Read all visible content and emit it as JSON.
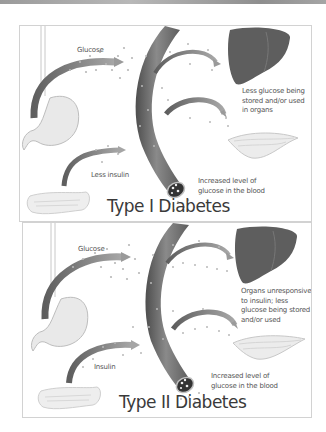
{
  "figure": {
    "colors": {
      "background": "#ffffff",
      "panel_border": "#d2d2d2",
      "arrow": "#7a7a7a",
      "vessel": "#6e6e6e",
      "liver": "#5a5a5a",
      "organ_light": "#e6e6e6",
      "text": "#555555",
      "title_text": "#3a3a3a"
    },
    "panels": [
      {
        "title": "Type I Diabetes",
        "labels": {
          "glucose": "Glucose",
          "insulin": "Less insulin",
          "organs": "Less glucose being stored and/or used in organs",
          "blood": "Increased level of glucose in the blood"
        },
        "organs": [
          "stomach",
          "pancreas",
          "blood-vessel",
          "liver",
          "muscle"
        ]
      },
      {
        "title": "Type II Diabetes",
        "labels": {
          "glucose": "Glucose",
          "insulin": "Insulin",
          "organs": "Organs unresponsive to insulin; less glucose being stored and/or used",
          "blood": "Increased level of glucose in the blood"
        },
        "organs": [
          "stomach",
          "pancreas",
          "blood-vessel",
          "liver",
          "muscle"
        ]
      }
    ]
  }
}
